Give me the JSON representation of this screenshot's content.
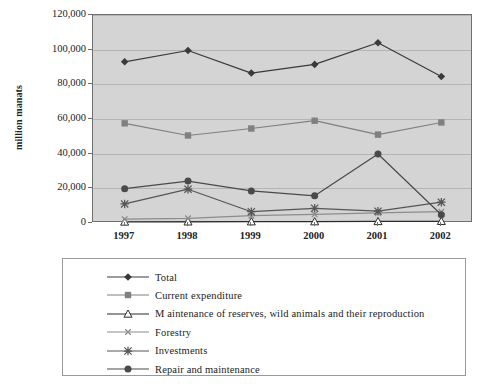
{
  "chart_data": {
    "type": "line",
    "title": "",
    "xlabel": "",
    "ylabel": "million manats",
    "categories": [
      "1997",
      "1998",
      "1999",
      "2000",
      "2001",
      "2002"
    ],
    "ylim": [
      0,
      120000
    ],
    "ytick_labels": [
      "0",
      "20,000",
      "40,000",
      "60,000",
      "80,000",
      "100,000",
      "120,000"
    ],
    "ytick_values": [
      0,
      20000,
      40000,
      60000,
      80000,
      100000,
      120000
    ],
    "grid": true,
    "legend_position": "bottom",
    "series": [
      {
        "name": "Total",
        "marker": "diamond",
        "color": "#3a3a3a",
        "values": [
          93000,
          99500,
          86500,
          91500,
          104000,
          84500
        ]
      },
      {
        "name": "Current expenditure",
        "marker": "square",
        "color": "#808080",
        "values": [
          57500,
          50500,
          54500,
          59000,
          51000,
          58000
        ]
      },
      {
        "name": "Maintenance of reserves, wild animals and their reproduction",
        "marker": "triangle",
        "color": "#2b2b2b",
        "values": [
          600,
          700,
          750,
          800,
          900,
          1000
        ]
      },
      {
        "name": "Forestry",
        "marker": "x",
        "color": "#8c8c8c",
        "values": [
          2200,
          2700,
          4200,
          5000,
          5800,
          6500
        ]
      },
      {
        "name": "Investments",
        "marker": "asterisk",
        "color": "#555555",
        "values": [
          11000,
          19500,
          6500,
          8500,
          6800,
          12000
        ]
      },
      {
        "name": "Repair and maintenance",
        "marker": "circle",
        "color": "#4a4a4a",
        "values": [
          19800,
          24200,
          18500,
          15700,
          39800,
          4800
        ]
      }
    ]
  },
  "legend": {
    "items": [
      {
        "label": "Total",
        "marker": "diamond"
      },
      {
        "label": "Current expenditure",
        "marker": "square"
      },
      {
        "label": "M aintenance of reserves, wild animals and their reproduction",
        "marker": "triangle"
      },
      {
        "label": "Forestry",
        "marker": "x"
      },
      {
        "label": "Investments",
        "marker": "asterisk"
      },
      {
        "label": "Repair and maintenance",
        "marker": "circle"
      }
    ]
  },
  "colors": {
    "plot_background": "#d4d4d4",
    "plot_border": "#6f6f6f",
    "gridline": "#b4b4b4",
    "page_background": "#ffffff"
  }
}
